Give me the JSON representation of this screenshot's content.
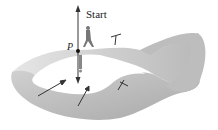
{
  "figure": {
    "labels": {
      "start": "Start",
      "point": "P"
    },
    "colors": {
      "surface_light": "#e8e8e8",
      "surface_mid": "#c8c8c8",
      "surface_dark": "#a0a0a0",
      "arrow": "#333333"
    }
  }
}
